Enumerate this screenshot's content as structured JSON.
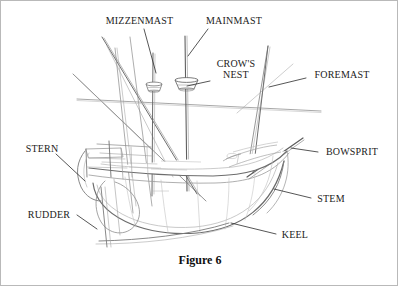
{
  "figure": {
    "caption": "Figure 6",
    "caption_top": 252,
    "medium": "pencil-sketch",
    "background_color": "#ffffff",
    "border_color": "#b9b9b9",
    "ink_color": "#4a4a4a",
    "ink_color_light": "#9a9a9a",
    "ink_color_dark": "#2e2e2e",
    "label_color": "#1b1b1b"
  },
  "labels": [
    {
      "id": "mizzenmast",
      "text": "MIZZENMAST",
      "x": 101,
      "y": 14,
      "width": 75,
      "leader": {
        "x1": 143,
        "y1": 28,
        "x2": 155,
        "y2": 72
      }
    },
    {
      "id": "mainmast",
      "text": "MAINMAST",
      "x": 200,
      "y": 14,
      "width": 66,
      "leader": {
        "x1": 207,
        "y1": 28,
        "x2": 187,
        "y2": 55
      }
    },
    {
      "id": "crows-nest-line-1",
      "text": "CROW'S",
      "x": 210,
      "y": 57,
      "width": 50,
      "leader": {
        "x1": 209,
        "y1": 80,
        "x2": 186,
        "y2": 85
      }
    },
    {
      "id": "crows-nest-line-2",
      "text": "NEST",
      "x": 210,
      "y": 68,
      "width": 50,
      "leader": null
    },
    {
      "id": "foremast",
      "text": "FOREMAST",
      "x": 307,
      "y": 68,
      "width": 68,
      "leader": {
        "x1": 305,
        "y1": 77,
        "x2": 268,
        "y2": 86
      }
    },
    {
      "id": "bowsprit",
      "text": "BOWSPRIT",
      "x": 319,
      "y": 145,
      "width": 64,
      "leader": {
        "x1": 317,
        "y1": 151,
        "x2": 290,
        "y2": 147
      }
    },
    {
      "id": "stem",
      "text": "STEM",
      "x": 312,
      "y": 192,
      "width": 36,
      "leader": {
        "x1": 310,
        "y1": 197,
        "x2": 273,
        "y2": 188
      }
    },
    {
      "id": "keel",
      "text": "KEEL",
      "x": 277,
      "y": 228,
      "width": 34,
      "leader": {
        "x1": 275,
        "y1": 233,
        "x2": 230,
        "y2": 222
      }
    },
    {
      "id": "stern",
      "text": "STERN",
      "x": 20,
      "y": 142,
      "width": 42,
      "leader": {
        "x1": 55,
        "y1": 153,
        "x2": 84,
        "y2": 180
      }
    },
    {
      "id": "rudder",
      "text": "RUDDER",
      "x": 22,
      "y": 208,
      "width": 52,
      "leader": {
        "x1": 76,
        "y1": 214,
        "x2": 96,
        "y2": 228
      }
    }
  ],
  "ship_parts": [
    {
      "name": "hull",
      "description": "curved wooden hull body"
    },
    {
      "name": "mainmast",
      "description": "tall central vertical mast"
    },
    {
      "name": "mizzenmast",
      "description": "rear mast, left of mainmast"
    },
    {
      "name": "foremast",
      "description": "forward mast, right side, raked"
    },
    {
      "name": "crows-nest-main",
      "description": "basket platform on mainmast"
    },
    {
      "name": "crows-nest-mizzen",
      "description": "basket platform on mizzenmast"
    },
    {
      "name": "bowsprit",
      "description": "angled spar projecting from the bow"
    },
    {
      "name": "stem",
      "description": "upward curved bow timber"
    },
    {
      "name": "keel",
      "description": "bottom longitudinal timber"
    },
    {
      "name": "stern",
      "description": "rear squared structure of the hull"
    },
    {
      "name": "rudder",
      "description": "steering blade at the stern"
    },
    {
      "name": "yard-spar",
      "description": "long horizontal spar crossing the masts"
    }
  ]
}
